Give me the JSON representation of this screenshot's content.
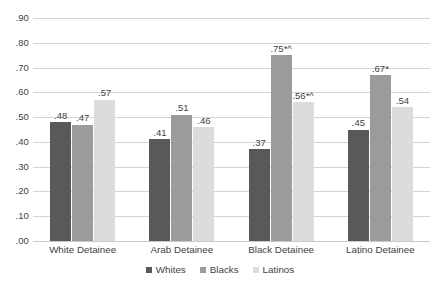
{
  "chart_data": {
    "type": "bar",
    "title": "",
    "subtitle": "",
    "xlabel": "",
    "ylabel": "",
    "categories": [
      "White Detainee",
      "Arab Detainee",
      "Black Detainee",
      "Latino Detainee"
    ],
    "series": [
      {
        "name": "Whites",
        "color": "#595959",
        "values": [
          0.48,
          0.41,
          0.37,
          0.45
        ],
        "labels": [
          ".48",
          ".41",
          ".37",
          ".45"
        ]
      },
      {
        "name": "Blacks",
        "color": "#9b9b9b",
        "values": [
          0.47,
          0.51,
          0.75,
          0.67
        ],
        "labels": [
          ".47",
          ".51",
          ".75*^",
          ".67*"
        ]
      },
      {
        "name": "Latinos",
        "color": "#dcdcdc",
        "values": [
          0.57,
          0.46,
          0.56,
          0.54
        ],
        "labels": [
          ".57",
          ".46",
          ".56*^",
          ".54"
        ]
      }
    ],
    "ylim": [
      0.0,
      0.9
    ],
    "ytick_values": [
      0.0,
      0.1,
      0.2,
      0.3,
      0.4,
      0.5,
      0.6,
      0.7,
      0.8,
      0.9
    ],
    "ytick_labels": [
      ".00",
      ".10",
      ".20",
      ".30",
      ".40",
      ".50",
      ".60",
      ".70",
      ".80",
      ".90"
    ],
    "grid": true,
    "grid_color": "#d4d4d4",
    "legend_position": "bottom",
    "legend_entries": [
      "Whites",
      "Blacks",
      "Latinos"
    ],
    "background": "#ffffff"
  }
}
